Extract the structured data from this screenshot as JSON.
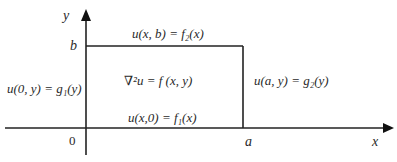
{
  "diagram": {
    "axes": {
      "x_label": "x",
      "y_label": "y",
      "origin_label": "0",
      "a_label": "a",
      "b_label": "b"
    },
    "boundary_conditions": {
      "top": "u(x, b) = f₂(x)",
      "bottom": "u(x,0) = f₁(x)",
      "left": "u(0, y) = g₁(y)",
      "right": "u(a, y) = g₂(y)"
    },
    "interior_equation": "∇²u = f (x, y)",
    "colors": {
      "line": "#222222",
      "text": "#2a2a2a",
      "background": "#ffffff"
    }
  }
}
